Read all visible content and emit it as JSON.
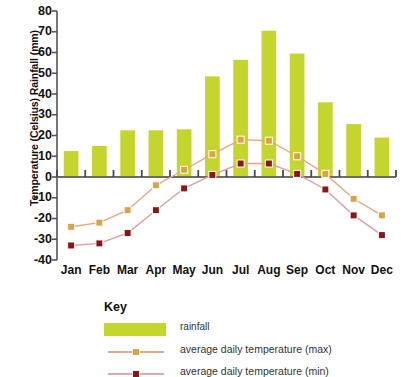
{
  "chart_data": {
    "type": "bar",
    "title": "",
    "subtitle": "",
    "xlabel": "",
    "ylabel": "Temperature (Celsius) Rainfall (mm)",
    "categories": [
      "Jan",
      "Feb",
      "Mar",
      "Apr",
      "May",
      "Jun",
      "Jul",
      "Aug",
      "Sep",
      "Oct",
      "Nov",
      "Dec"
    ],
    "ylim": [
      -40,
      80
    ],
    "y_ticks": [
      80,
      70,
      60,
      50,
      40,
      30,
      20,
      10,
      0,
      -10,
      -20,
      -30,
      -40
    ],
    "grid": false,
    "legend_position": "below-chart",
    "series": [
      {
        "name": "rainfall",
        "type": "bar",
        "unit": "mm",
        "color": "#c4d62e",
        "values": [
          12.5,
          15,
          22.5,
          22.5,
          23,
          48.5,
          56.5,
          70.5,
          59.5,
          36,
          25.5,
          19
        ]
      },
      {
        "name": "average daily temperature (max)",
        "type": "line",
        "unit": "Celsius",
        "color": "#e8a87c",
        "marker_color": "#d9a441",
        "values": [
          -24,
          -22,
          -16,
          -4,
          3.5,
          11,
          18,
          17.5,
          10,
          1.5,
          -10.5,
          -18.5
        ]
      },
      {
        "name": "average daily temperature (min)",
        "type": "line",
        "unit": "Celsius",
        "color": "#e0a0a0",
        "marker_color": "#8c1515",
        "values": [
          -33,
          -32,
          -27,
          -16,
          -5.5,
          1,
          6.5,
          6.5,
          1.5,
          -6,
          -18.5,
          -28
        ]
      }
    ]
  },
  "legend": {
    "title": "Key",
    "entries": [
      {
        "label": "rainfall",
        "kind": "bar"
      },
      {
        "label": "average daily temperature (max)",
        "kind": "line"
      },
      {
        "label": "average daily temperature (min)",
        "kind": "line"
      }
    ]
  },
  "colors": {
    "rainfall_bar": "#c4d62e",
    "temp_max_line": "#eaa98a",
    "temp_max_marker": "#d9a441",
    "temp_min_line": "#e3a7a7",
    "temp_min_marker": "#8c1515",
    "axis": "#555555",
    "text": "#111111"
  }
}
